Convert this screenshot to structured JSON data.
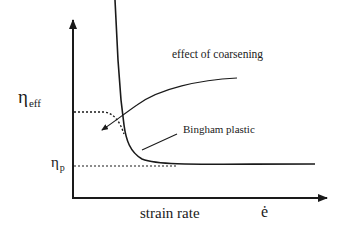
{
  "diagram": {
    "type": "schematic-plot",
    "y_axis_label": "η",
    "y_axis_label_sub": "eff",
    "y_reference_label": "η",
    "y_reference_label_sub": "p",
    "x_axis_label": "strain rate",
    "x_axis_symbol": "ė",
    "annotations": [
      {
        "text": "effect of coarsening",
        "points_to": "dotted-plateau-curve"
      },
      {
        "text": "Bingham plastic",
        "points_to": "solid-curve"
      }
    ],
    "curves": [
      {
        "name": "Bingham plastic",
        "style": "solid",
        "description": "Effective viscosity diverges at low strain rate, decreasing steeply and approaching η_p asymptotically"
      },
      {
        "name": "effect of coarsening",
        "style": "dotted",
        "description": "Finite plateau of effective viscosity at low strain rate, merging with Bingham curve at higher rates"
      },
      {
        "name": "eta_p reference",
        "style": "dotted",
        "description": "Horizontal asymptote at plastic viscosity η_p"
      }
    ],
    "colors": {
      "ink": "#1a1a1a",
      "background": "#ffffff"
    }
  }
}
